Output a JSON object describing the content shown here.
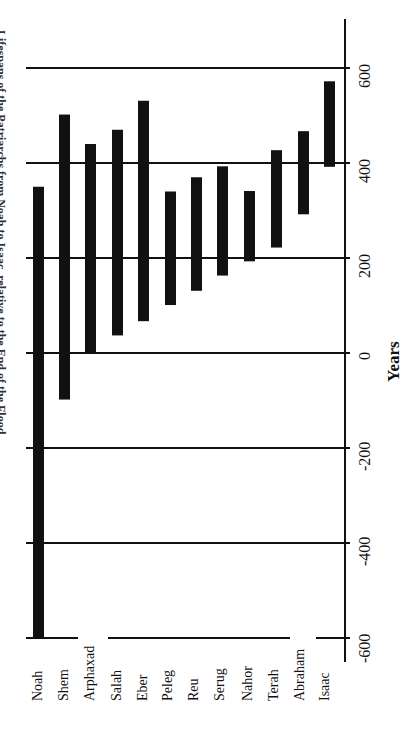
{
  "chart_data": {
    "type": "bar",
    "orientation": "rotated-floating-range",
    "xlabel": "",
    "ylabel": "Years",
    "ylim": [
      -600,
      700
    ],
    "yticks": [
      600,
      400,
      200,
      0,
      -200,
      -400,
      -600
    ],
    "grid": true,
    "legend": "none",
    "categories": [
      "Noah",
      "Shem",
      "Arphaxad",
      "Salah",
      "Eber",
      "Peleg",
      "Reu",
      "Serug",
      "Nahor",
      "Terah",
      "Abraham",
      "Isaac"
    ],
    "series": [
      {
        "name": "start",
        "values": [
          -600,
          -98,
          2,
          37,
          67,
          101,
          131,
          163,
          193,
          222,
          292,
          392
        ]
      },
      {
        "name": "end",
        "values": [
          350,
          502,
          440,
          470,
          531,
          340,
          370,
          393,
          341,
          427,
          467,
          572
        ]
      }
    ],
    "bar_color": "#111111"
  },
  "labels": {
    "title": "Lifespans of the Patriarchs from Noah to Isaac, relative to the End of the Flood",
    "axis_title": "Years",
    "ticks": [
      "600",
      "400",
      "200",
      "0",
      "-200",
      "-400",
      "-600"
    ],
    "categories": [
      "Noah",
      "Shem",
      "Arphaxad",
      "Salah",
      "Eber",
      "Peleg",
      "Reu",
      "Serug",
      "Nahor",
      "Terah",
      "Abraham",
      "Isaac"
    ]
  }
}
